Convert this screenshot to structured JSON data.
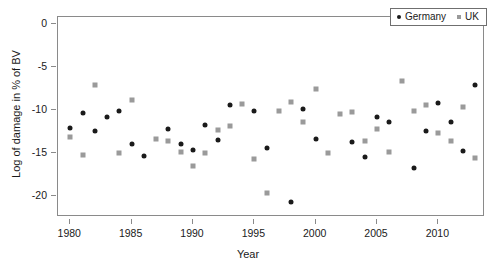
{
  "chart_data": {
    "type": "scatter",
    "title": "",
    "xlabel": "Year",
    "ylabel": "Log of damage in % of BV",
    "xlim": [
      1979.0,
      2013.8
    ],
    "ylim": [
      -22.5,
      0.8
    ],
    "xticks": [
      1980,
      1985,
      1990,
      1995,
      2000,
      2005,
      2010
    ],
    "xticklabels": [
      "1980",
      "1985",
      "1990",
      "1995",
      "2000",
      "2005",
      "2010"
    ],
    "yticks": [
      0,
      -5,
      -10,
      -15,
      -20
    ],
    "yticklabels": [
      "0",
      "-5",
      "-10",
      "-15",
      "-20"
    ],
    "grid": false,
    "legend_position": "top-right",
    "series": [
      {
        "name": "Germany",
        "marker": "circle",
        "color": "#1a1a1a",
        "x": [
          1980,
          1981,
          1982,
          1983,
          1984,
          1985,
          1986,
          1988,
          1989,
          1990,
          1991,
          1992,
          1993,
          1995,
          1996,
          1998,
          1999,
          2000,
          2003,
          2004,
          2005,
          2006,
          2008,
          2009,
          2010,
          2011,
          2012,
          2013
        ],
        "y": [
          -12.1,
          -10.4,
          -12.5,
          -10.8,
          -10.2,
          -14.0,
          -15.4,
          -12.2,
          -14.0,
          -14.7,
          -11.8,
          -13.5,
          -9.5,
          -10.2,
          -14.5,
          -20.8,
          -9.9,
          -13.4,
          -13.8,
          -15.5,
          -10.9,
          -11.4,
          -16.8,
          -12.5,
          -9.2,
          -11.4,
          -14.8,
          -7.1
        ]
      },
      {
        "name": "UK",
        "marker": "square",
        "color": "#9a9a9a",
        "x": [
          1980,
          1981,
          1982,
          1984,
          1985,
          1987,
          1988,
          1989,
          1990,
          1991,
          1992,
          1993,
          1994,
          1995,
          1996,
          1997,
          1998,
          1999,
          2000,
          2001,
          2002,
          2003,
          2004,
          2005,
          2006,
          2007,
          2008,
          2009,
          2010,
          2011,
          2012,
          2013
        ],
        "y": [
          -13.2,
          -15.3,
          -7.1,
          -15.1,
          -8.9,
          -13.4,
          -13.7,
          -14.9,
          -16.5,
          -15.0,
          -12.4,
          -11.9,
          -9.3,
          -15.8,
          -19.7,
          -10.1,
          -9.1,
          -11.4,
          -7.6,
          -15.0,
          -10.5,
          -10.3,
          -13.7,
          -12.3,
          -14.9,
          -6.6,
          -10.1,
          -9.4,
          -12.7,
          -13.7,
          -9.7,
          -15.6
        ]
      }
    ]
  },
  "legend": {
    "entries": [
      {
        "label": "Germany",
        "marker": "circle-marker-black"
      },
      {
        "label": "UK",
        "marker": "square-marker-gray"
      }
    ]
  }
}
